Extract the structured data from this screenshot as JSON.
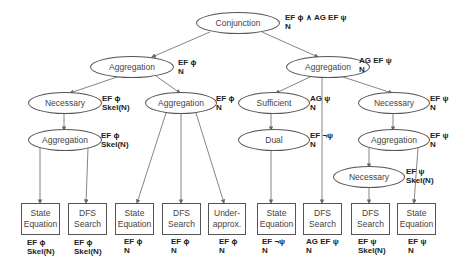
{
  "nodes": {
    "conjunction": {
      "label": "Conjunction",
      "ann1": "EF ϕ ∧ AG EF ψ",
      "ann2": "N"
    },
    "agg_left": {
      "label": "Aggregation",
      "ann1": "EF ϕ",
      "ann2": "N"
    },
    "agg_right": {
      "label": "Aggregation",
      "ann1": "AG EF ψ",
      "ann2": "N"
    },
    "nec_l": {
      "label": "Necessary",
      "ann1": "EF ϕ",
      "ann2": "Skel(N)"
    },
    "agg_l2": {
      "label": "Aggregation",
      "ann1": "EF ϕ",
      "ann2": "N"
    },
    "agg_l3": {
      "label": "Aggregation",
      "ann1": "EF ϕ",
      "ann2": "Skel(N)"
    },
    "sufficient": {
      "label": "Sufficient",
      "ann1": "AG ψ",
      "ann2": "N"
    },
    "dual": {
      "label": "Dual",
      "ann1": "EF ¬ψ",
      "ann2": "N"
    },
    "nec_r": {
      "label": "Necessary",
      "ann1": "EF ψ",
      "ann2": "N"
    },
    "agg_r2": {
      "label": "Aggregation",
      "ann1": "EF ψ",
      "ann2": "N"
    },
    "nec_r2": {
      "label": "Necessary",
      "ann1": "EF ψ",
      "ann2": "Skel(N)"
    }
  },
  "leaves": [
    {
      "line1": "State",
      "line2": "Equation",
      "ann1": "EF ϕ",
      "ann2": "Skel(N)"
    },
    {
      "line1": "DFS",
      "line2": "Search",
      "ann1": "EF ϕ",
      "ann2": "Skel(N)"
    },
    {
      "line1": "State",
      "line2": "Equation",
      "ann1": "EF ϕ",
      "ann2": "N"
    },
    {
      "line1": "DFS",
      "line2": "Search",
      "ann1": "EF ϕ",
      "ann2": "N"
    },
    {
      "line1": "Under-",
      "line2": "approx.",
      "ann1": "EF ϕ",
      "ann2": "N"
    },
    {
      "line1": "State",
      "line2": "Equation",
      "ann1": "EF ¬ψ",
      "ann2": "N"
    },
    {
      "line1": "DFS",
      "line2": "Search",
      "ann1": "AG EF ψ",
      "ann2": "N"
    },
    {
      "line1": "DFS",
      "line2": "Search",
      "ann1": "EF ψ",
      "ann2": "Skel(N)"
    },
    {
      "line1": "State",
      "line2": "Equation",
      "ann1": "EF ψ",
      "ann2": "N"
    }
  ]
}
